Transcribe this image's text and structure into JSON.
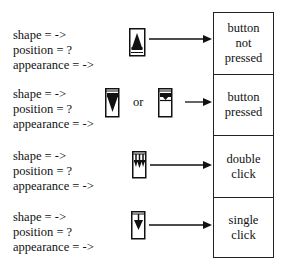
{
  "rows": [
    {
      "spec": {
        "shape": "shape = ->",
        "position": "position = ?",
        "appearance": "appearance = ->"
      },
      "icon": "scroll-arrow-up-filled-icon",
      "meaning": [
        "button",
        "not",
        "pressed"
      ]
    },
    {
      "spec": {
        "shape": "shape = ->",
        "position": "position = ?",
        "appearance": "appearance = ->"
      },
      "icon": "scroll-arrow-down-pressed-icon",
      "alt_icon": "scroll-box-pressed-top-icon",
      "or_label": "or",
      "meaning": [
        "button",
        "pressed"
      ]
    },
    {
      "spec": {
        "shape": "shape = ->",
        "position": "position = ?",
        "appearance": "appearance = ->"
      },
      "icon": "double-click-arrow-icon",
      "meaning": [
        "double",
        "click"
      ]
    },
    {
      "spec": {
        "shape": "shape = ->",
        "position": "position = ?",
        "appearance": "appearance = ->"
      },
      "icon": "single-click-arrow-icon",
      "meaning": [
        "single",
        "click"
      ]
    }
  ],
  "colors": {
    "ink": "#111111",
    "background": "#ffffff"
  }
}
